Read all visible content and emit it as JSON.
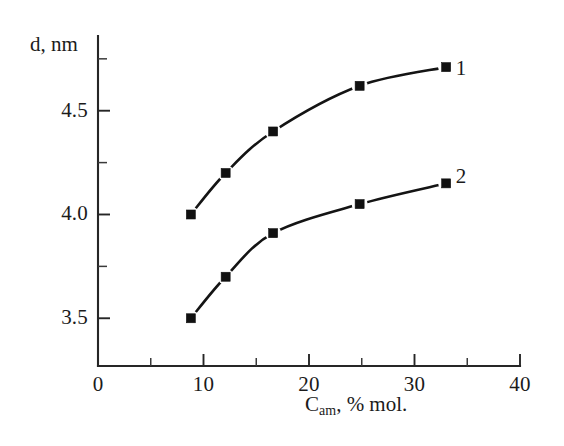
{
  "figure": {
    "background_color": "#ffffff",
    "ink_color": "#141414"
  },
  "axes": {
    "y_title": "d, nm",
    "x_title_main": "C",
    "x_title_sub": "am",
    "x_title_rest": ", % mol."
  },
  "chart_data": {
    "type": "line",
    "title": "",
    "xlabel": "C_am, % mol.",
    "ylabel": "d, nm",
    "xlim": [
      0,
      40
    ],
    "ylim": [
      3.27,
      4.86
    ],
    "grid": false,
    "legend": "inline-curve-labels",
    "x_ticks": [
      0,
      10,
      20,
      30,
      40
    ],
    "x_tick_labels": [
      "0",
      "10",
      "20",
      "30",
      "40"
    ],
    "x_minor_ticks": [
      5,
      15,
      25,
      35
    ],
    "y_ticks": [
      3.5,
      4.0,
      4.5
    ],
    "y_tick_labels": [
      "3.5",
      "4.0",
      "4.5"
    ],
    "y_minor_ticks": [
      3.75,
      4.25,
      4.75
    ],
    "marker": "filled-square",
    "series": [
      {
        "name": "1",
        "label": "1",
        "label_x": 33.9,
        "label_y": 4.7,
        "x": [
          8.8,
          12.1,
          16.6,
          24.8,
          33.0
        ],
        "values": [
          4.0,
          4.2,
          4.4,
          4.62,
          4.71
        ]
      },
      {
        "name": "2",
        "label": "2",
        "label_x": 33.9,
        "label_y": 4.18,
        "x": [
          8.8,
          12.1,
          16.6,
          24.8,
          33.0
        ],
        "values": [
          3.5,
          3.7,
          3.91,
          4.05,
          4.15
        ]
      }
    ]
  }
}
